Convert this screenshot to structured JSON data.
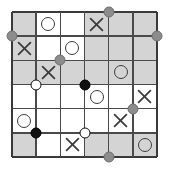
{
  "diagram": {
    "type": "logic-grid-puzzle",
    "rows": 6,
    "cols": 6,
    "cell_size": 24.1667,
    "origin": {
      "x": 12,
      "y": 12
    },
    "colors": {
      "shaded_cell": "#d4d4d4",
      "plain_cell": "#ffffff",
      "grid_line": "#4a4a4a",
      "border_line": "#3a3a3a",
      "glyph": "#3d3d3d",
      "node_gray": "#8c8c8c",
      "node_black": "#111111",
      "node_white": "#ffffff",
      "background": "#ffffff"
    },
    "legend": {
      "shaded": "shaded cell",
      "plain": "plain cell",
      "o": "circle mark",
      "x": "cross mark",
      "gray_node": "gray node",
      "black_node": "black node",
      "white_node": "white node"
    },
    "cells": [
      [
        {
          "row": 1,
          "col": 1,
          "shade": "shaded",
          "mark": ""
        },
        {
          "row": 1,
          "col": 2,
          "shade": "plain",
          "mark": "O"
        },
        {
          "row": 1,
          "col": 3,
          "shade": "plain",
          "mark": ""
        },
        {
          "row": 1,
          "col": 4,
          "shade": "shaded",
          "mark": "X"
        },
        {
          "row": 1,
          "col": 5,
          "shade": "shaded",
          "mark": ""
        },
        {
          "row": 1,
          "col": 6,
          "shade": "shaded",
          "mark": ""
        }
      ],
      [
        {
          "row": 2,
          "col": 1,
          "shade": "shaded",
          "mark": "X"
        },
        {
          "row": 2,
          "col": 2,
          "shade": "plain",
          "mark": ""
        },
        {
          "row": 2,
          "col": 3,
          "shade": "plain",
          "mark": "O"
        },
        {
          "row": 2,
          "col": 4,
          "shade": "shaded",
          "mark": ""
        },
        {
          "row": 2,
          "col": 5,
          "shade": "shaded",
          "mark": ""
        },
        {
          "row": 2,
          "col": 6,
          "shade": "shaded",
          "mark": ""
        }
      ],
      [
        {
          "row": 3,
          "col": 1,
          "shade": "shaded",
          "mark": ""
        },
        {
          "row": 3,
          "col": 2,
          "shade": "shaded",
          "mark": "X"
        },
        {
          "row": 3,
          "col": 3,
          "shade": "shaded",
          "mark": ""
        },
        {
          "row": 3,
          "col": 4,
          "shade": "shaded",
          "mark": ""
        },
        {
          "row": 3,
          "col": 5,
          "shade": "shaded",
          "mark": "O"
        },
        {
          "row": 3,
          "col": 6,
          "shade": "shaded",
          "mark": ""
        }
      ],
      [
        {
          "row": 4,
          "col": 1,
          "shade": "plain",
          "mark": ""
        },
        {
          "row": 4,
          "col": 2,
          "shade": "plain",
          "mark": ""
        },
        {
          "row": 4,
          "col": 3,
          "shade": "plain",
          "mark": ""
        },
        {
          "row": 4,
          "col": 4,
          "shade": "plain",
          "mark": "O"
        },
        {
          "row": 4,
          "col": 5,
          "shade": "plain",
          "mark": ""
        },
        {
          "row": 4,
          "col": 6,
          "shade": "plain",
          "mark": "X"
        }
      ],
      [
        {
          "row": 5,
          "col": 1,
          "shade": "plain",
          "mark": "O"
        },
        {
          "row": 5,
          "col": 2,
          "shade": "plain",
          "mark": ""
        },
        {
          "row": 5,
          "col": 3,
          "shade": "plain",
          "mark": ""
        },
        {
          "row": 5,
          "col": 4,
          "shade": "plain",
          "mark": ""
        },
        {
          "row": 5,
          "col": 5,
          "shade": "plain",
          "mark": "X"
        },
        {
          "row": 5,
          "col": 6,
          "shade": "plain",
          "mark": ""
        }
      ],
      [
        {
          "row": 6,
          "col": 1,
          "shade": "shaded",
          "mark": ""
        },
        {
          "row": 6,
          "col": 2,
          "shade": "plain",
          "mark": ""
        },
        {
          "row": 6,
          "col": 3,
          "shade": "plain",
          "mark": "X"
        },
        {
          "row": 6,
          "col": 4,
          "shade": "shaded",
          "mark": ""
        },
        {
          "row": 6,
          "col": 5,
          "shade": "shaded",
          "mark": ""
        },
        {
          "row": 6,
          "col": 6,
          "shade": "shaded",
          "mark": "O"
        }
      ]
    ],
    "nodes": [
      {
        "id": "node-1",
        "gx": 4,
        "gy": 0,
        "kind": "gray"
      },
      {
        "id": "node-2",
        "gx": 0,
        "gy": 1,
        "kind": "gray"
      },
      {
        "id": "node-3",
        "gx": 6,
        "gy": 1,
        "kind": "gray"
      },
      {
        "id": "node-4",
        "gx": 2,
        "gy": 2,
        "kind": "gray"
      },
      {
        "id": "node-5",
        "gx": 1,
        "gy": 3,
        "kind": "white"
      },
      {
        "id": "node-6",
        "gx": 3,
        "gy": 3,
        "kind": "black"
      },
      {
        "id": "node-7",
        "gx": 5,
        "gy": 4,
        "kind": "gray"
      },
      {
        "id": "node-8",
        "gx": 1,
        "gy": 5,
        "kind": "black"
      },
      {
        "id": "node-9",
        "gx": 3,
        "gy": 5,
        "kind": "white"
      },
      {
        "id": "node-10",
        "gx": 4,
        "gy": 6,
        "kind": "gray"
      }
    ]
  }
}
